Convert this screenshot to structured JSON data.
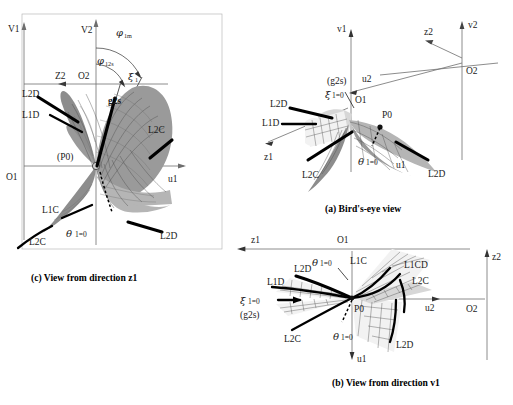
{
  "figure": {
    "panels": [
      {
        "id": "c",
        "caption": "(c) View from direction z1",
        "axes": [
          {
            "name": "V1",
            "label": "V1"
          },
          {
            "name": "V2",
            "label": "V2"
          },
          {
            "name": "u1",
            "label": "u1"
          },
          {
            "name": "Z2",
            "label": "Z2"
          },
          {
            "name": "O1",
            "label": "O1"
          },
          {
            "name": "O2",
            "label": "O2"
          }
        ],
        "angles": [
          {
            "name": "phi-1m",
            "symbol": "φ",
            "sub": "1m"
          },
          {
            "name": "phi-12s",
            "symbol": "φ",
            "sub": "12s"
          },
          {
            "name": "xi-1",
            "symbol": "ξ",
            "sub": "1"
          },
          {
            "name": "theta-1",
            "symbol": "θ",
            "sub": "1=0"
          }
        ],
        "points": [
          {
            "name": "P0",
            "label": "(P0)"
          },
          {
            "name": "g2s",
            "label": "g2s"
          }
        ],
        "curves": [
          "L2D",
          "L1D",
          "L2C",
          "L1C",
          "L2C",
          "L2D"
        ]
      },
      {
        "id": "a",
        "caption": "(a) Bird's-eye view",
        "axes": [
          {
            "name": "v1",
            "label": "v1"
          },
          {
            "name": "v2",
            "label": "v2"
          },
          {
            "name": "z1",
            "label": "z1"
          },
          {
            "name": "z2",
            "label": "z2"
          },
          {
            "name": "u1",
            "label": "u1"
          },
          {
            "name": "u2",
            "label": "u2"
          },
          {
            "name": "O1",
            "label": "O1"
          },
          {
            "name": "O2",
            "label": "O2"
          }
        ],
        "angles": [
          {
            "name": "xi-1",
            "symbol": "ξ",
            "sub": "1=0"
          },
          {
            "name": "theta-1",
            "symbol": "θ",
            "sub": "1=0"
          }
        ],
        "points": [
          {
            "name": "P0",
            "label": "P0"
          },
          {
            "name": "g2s",
            "label": "(g2s)"
          }
        ],
        "curves": [
          "L2D",
          "L1D",
          "L2C",
          "L2D"
        ]
      },
      {
        "id": "b",
        "caption": "(b) View from direction v1",
        "axes": [
          {
            "name": "z1",
            "label": "z1"
          },
          {
            "name": "z2",
            "label": "z2"
          },
          {
            "name": "u1",
            "label": "u1"
          },
          {
            "name": "u2",
            "label": "u2"
          },
          {
            "name": "O1",
            "label": "O1"
          },
          {
            "name": "O2",
            "label": "O2"
          }
        ],
        "angles": [
          {
            "name": "theta-1-upper",
            "symbol": "θ",
            "sub": "1=0"
          },
          {
            "name": "theta-1-lower",
            "symbol": "θ",
            "sub": "1=0"
          },
          {
            "name": "xi-1",
            "symbol": "ξ",
            "sub": "1=0"
          }
        ],
        "points": [
          {
            "name": "P0",
            "label": "P0"
          },
          {
            "name": "g2s",
            "label": "(g2s)"
          }
        ],
        "curves": [
          "L2D",
          "L1D",
          "L1C",
          "L1CD",
          "L2C",
          "L2C",
          "L2D"
        ]
      }
    ],
    "colors": {
      "ink": "#1a1a1a",
      "axis": "#6e6e6e",
      "surface_dark": "#8d8d8d",
      "surface_mid": "#9a9a9a",
      "surface_light": "#d7d7d7",
      "background": "#ffffff"
    }
  },
  "labels": {
    "V1": "V1",
    "V2": "V2",
    "Z2": "Z2",
    "Z1": "Z1",
    "O1": "O1",
    "O2": "O2",
    "u1": "u1",
    "u2": "u2",
    "v1": "v1",
    "v2": "v2",
    "z1": "z1",
    "z2": "z2",
    "L1C": "L1C",
    "L2C": "L2C",
    "L1D": "L1D",
    "L2D": "L2D",
    "L1CD": "L1CD",
    "P0_paren": "(P0)",
    "P0": "P0",
    "g2s": "g2s",
    "g2s_paren": "(g2s)",
    "phi": "φ",
    "xi": "ξ",
    "theta": "θ",
    "sub_1m": "1m",
    "sub_12s": "12s",
    "sub_1": "1",
    "eq0": "1=0"
  },
  "captions": {
    "a": "(a) Bird's-eye view",
    "b": "(b) View from direction v1",
    "c": "(c) View from direction z1"
  }
}
